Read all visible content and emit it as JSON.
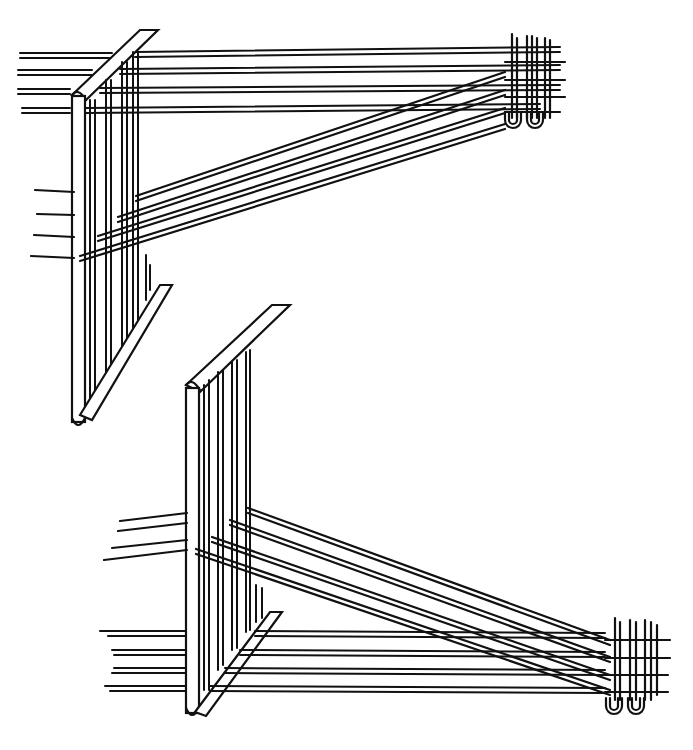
{
  "figure": {
    "type": "line-illustration",
    "colors": {
      "ink": "#111111",
      "background": "#ffffff"
    },
    "panels": [
      {
        "id": "top",
        "description": "Upper view: horizontal warp threads leading right to woven selvedge with loops; diagonal crossing threads and a slanted bar at left"
      },
      {
        "id": "bottom",
        "description": "Lower view: mirrored arrangement with slanted bar at top-left, diagonal threads descending to woven selvedge with loops at lower right"
      }
    ]
  }
}
